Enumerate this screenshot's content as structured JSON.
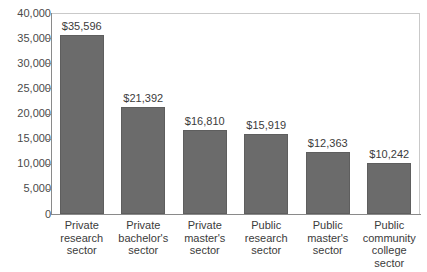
{
  "chart_data": {
    "type": "bar",
    "title": "",
    "subtitle": "",
    "xlabel": "",
    "ylabel": "",
    "ylim": [
      0,
      40000
    ],
    "ytick_step": 5000,
    "grid": false,
    "legend": "none",
    "ytick_labels": [
      "40,000",
      "35,000",
      "30,000",
      "25,000",
      "20,000",
      "15,000",
      "10,000",
      "5,000",
      "0"
    ],
    "ytick_values": [
      40000,
      35000,
      30000,
      25000,
      20000,
      15000,
      10000,
      5000,
      0
    ],
    "categories": [
      "Private research sector",
      "Private bachelor's sector",
      "Private master's sector",
      "Public research sector",
      "Public master's sector",
      "Public community college sector"
    ],
    "category_lines": [
      [
        "Private",
        "research",
        "sector"
      ],
      [
        "Private",
        "bachelor's",
        "sector"
      ],
      [
        "Private",
        "master's",
        "sector"
      ],
      [
        "Public",
        "research",
        "sector"
      ],
      [
        "Public",
        "master's",
        "sector"
      ],
      [
        "Public",
        "community",
        "college",
        "sector"
      ]
    ],
    "values": [
      35596,
      21392,
      16810,
      15919,
      12363,
      10242
    ],
    "value_labels": [
      "$35,596",
      "$21,392",
      "$16,810",
      "$15,919",
      "$12,363",
      "$10,242"
    ],
    "colors": {
      "bar_fill": "#6b6b6b",
      "bar_stroke": "#5e5e5e",
      "axis": "#8a8a8a",
      "frame": "#c9c9c9",
      "text": "#3b3b3b",
      "background": "#ffffff"
    }
  }
}
